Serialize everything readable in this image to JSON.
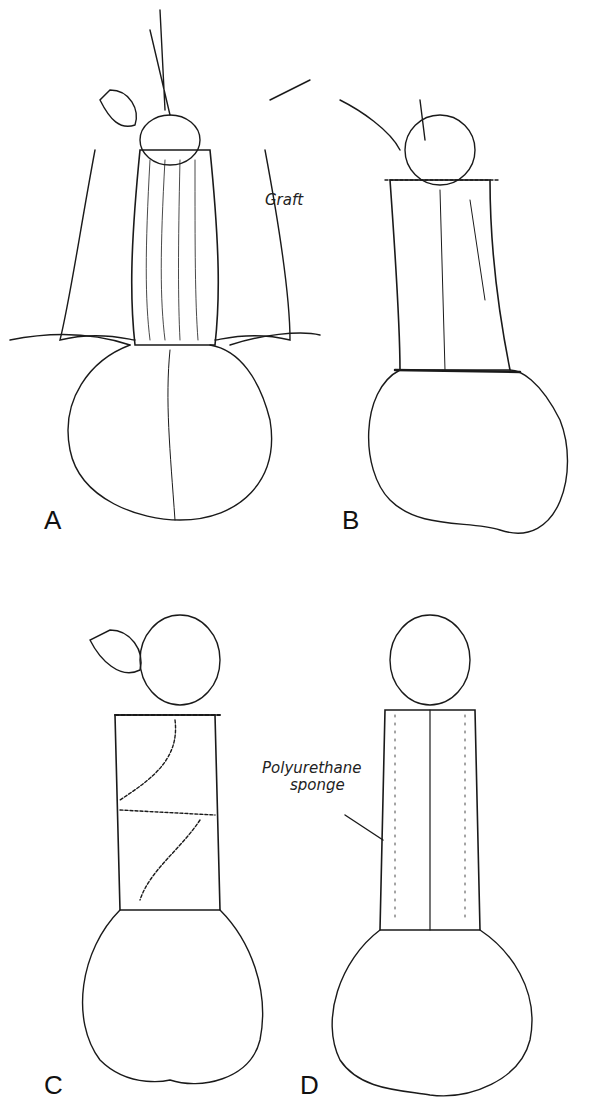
{
  "figure": {
    "panels": [
      {
        "id": "A",
        "label": "A",
        "annotation": "Graft"
      },
      {
        "id": "B",
        "label": "B"
      },
      {
        "id": "C",
        "label": "C"
      },
      {
        "id": "D",
        "label": "D",
        "annotation_line1": "Polyurethane",
        "annotation_line2": "sponge"
      }
    ],
    "colors": {
      "line": "#1a1a1a",
      "background": "#ffffff"
    }
  }
}
